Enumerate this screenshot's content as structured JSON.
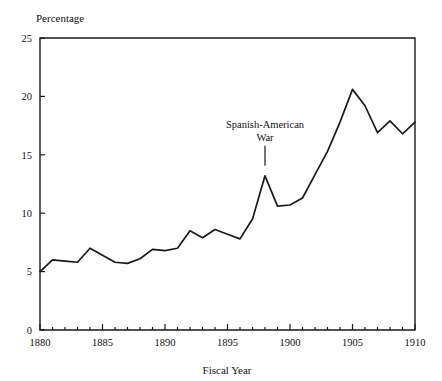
{
  "chart_data": {
    "type": "line",
    "title": "",
    "xlabel": "Fiscal Year",
    "ylabel": "Percentage",
    "xlim": [
      1880,
      1910
    ],
    "ylim": [
      0,
      25
    ],
    "grid": false,
    "legend": null,
    "x": [
      1880,
      1881,
      1882,
      1883,
      1884,
      1885,
      1886,
      1887,
      1888,
      1889,
      1890,
      1891,
      1892,
      1893,
      1894,
      1895,
      1896,
      1897,
      1898,
      1899,
      1900,
      1901,
      1902,
      1903,
      1904,
      1905,
      1906,
      1907,
      1908,
      1909,
      1910
    ],
    "values": [
      5.0,
      6.0,
      5.9,
      5.8,
      7.0,
      6.4,
      5.8,
      5.7,
      6.1,
      6.9,
      6.8,
      7.0,
      8.5,
      7.9,
      8.6,
      8.2,
      7.8,
      9.5,
      13.2,
      10.6,
      10.7,
      11.3,
      13.3,
      15.3,
      17.8,
      20.6,
      19.2,
      16.9,
      17.9,
      16.8,
      17.8
    ],
    "xticks": [
      1880,
      1885,
      1890,
      1895,
      1900,
      1905,
      1910
    ],
    "xticklabels": [
      "1880",
      "1885",
      "1890",
      "1895",
      "1900",
      "1905",
      "1910"
    ],
    "yticks": [
      0,
      5,
      10,
      15,
      20,
      25
    ],
    "yticklabels": [
      "0",
      "5",
      "10",
      "15",
      "20",
      "25"
    ],
    "annotations": [
      {
        "text_line1": "Spanish-American",
        "text_line2": "War",
        "at_x": 1898,
        "at_y": 13.2
      }
    ],
    "colors": {
      "line": "#1a1a1a",
      "axis": "#1a1a1a",
      "background": "#ffffff",
      "text": "#111111"
    }
  }
}
